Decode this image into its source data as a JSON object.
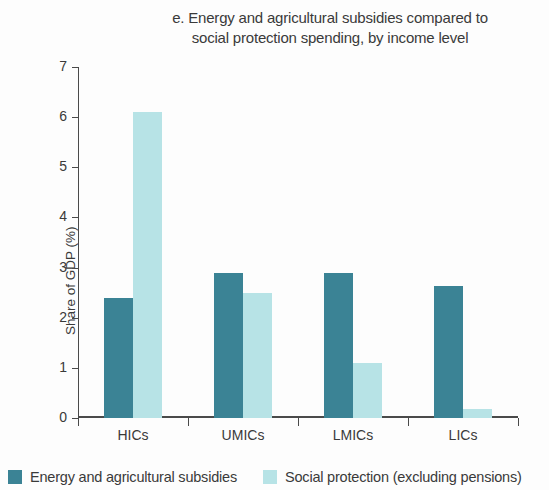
{
  "chart_data": {
    "type": "bar",
    "title": "e. Energy and agricultural subsidies compared to\nsocial protection spending, by income level",
    "xlabel": "",
    "ylabel": "Share of GDP (%)",
    "ylim": [
      0,
      7
    ],
    "ytick_labels": [
      "0",
      "1",
      "2",
      "3",
      "4",
      "5",
      "6",
      "7"
    ],
    "ytick_values": [
      0,
      1,
      2,
      3,
      4,
      5,
      6,
      7
    ],
    "grid": false,
    "legend_position": "bottom",
    "categories": [
      "HICs",
      "UMICs",
      "LMICs",
      "LICs"
    ],
    "series": [
      {
        "name": "Energy and agricultural subsidies",
        "color": "#3b8395",
        "values": [
          2.4,
          2.9,
          2.9,
          2.63
        ]
      },
      {
        "name": "Social protection (excluding pensions)",
        "color": "#b7e3e6",
        "values": [
          6.1,
          2.5,
          1.1,
          0.18
        ]
      }
    ]
  },
  "legend": {
    "entries": [
      {
        "label": "Energy and agricultural subsidies",
        "swatch": "dark"
      },
      {
        "label": "Social protection (excluding pensions)",
        "swatch": "light"
      }
    ]
  }
}
